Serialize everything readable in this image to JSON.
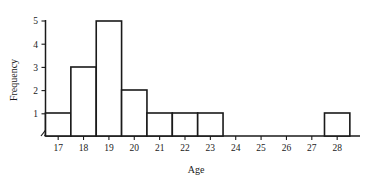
{
  "chart_data": {
    "type": "bar",
    "title": "",
    "subtitle": "",
    "xlabel": "Age",
    "ylabel": "Frequency",
    "categories": [
      17,
      18,
      19,
      20,
      21,
      22,
      23,
      24,
      25,
      26,
      27,
      28
    ],
    "values": [
      1,
      3,
      5,
      2,
      1,
      1,
      1,
      0,
      0,
      0,
      0,
      1
    ],
    "xticklabels": [
      "17",
      "18",
      "19",
      "20",
      "21",
      "22",
      "23",
      "24",
      "25",
      "26",
      "27",
      "28"
    ],
    "yticklabels": [
      "1",
      "2",
      "3",
      "4",
      "5"
    ],
    "yticks": [
      1,
      2,
      3,
      4,
      5
    ],
    "xlim": [
      16.5,
      28.9
    ],
    "ylim": [
      0,
      5
    ],
    "grid": false,
    "legend": null,
    "bar_fill_color": "#ffffff",
    "bar_edge_color": "#1a1a1a",
    "axis_color": "#1a1a1a",
    "axis_break": "//",
    "bin_width": 1
  }
}
